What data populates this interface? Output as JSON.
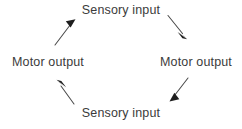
{
  "diagram": {
    "type": "cycle",
    "direction": "clockwise",
    "background_color": "#ffffff",
    "text_color": "#3b3b3b",
    "arrow_color": "#4a4a4a",
    "nodes": [
      {
        "id": "top",
        "label": "Sensory input",
        "position": "top"
      },
      {
        "id": "right",
        "label": "Motor output",
        "position": "right"
      },
      {
        "id": "bottom",
        "label": "Sensory input",
        "position": "bottom"
      },
      {
        "id": "left",
        "label": "Motor output",
        "position": "left"
      }
    ],
    "arrows": [
      {
        "id": "top-to-right",
        "from": "top",
        "to": "right",
        "name": "arrow-top-right",
        "points_toward": "down-right"
      },
      {
        "id": "right-to-bottom",
        "from": "right",
        "to": "bottom",
        "name": "arrow-bottom-right",
        "points_toward": "down-left"
      },
      {
        "id": "bottom-to-left",
        "from": "bottom",
        "to": "left",
        "name": "arrow-bottom-left",
        "points_toward": "up-left"
      },
      {
        "id": "left-to-top",
        "from": "left",
        "to": "top",
        "name": "arrow-top-left",
        "points_toward": "up-right"
      }
    ]
  }
}
